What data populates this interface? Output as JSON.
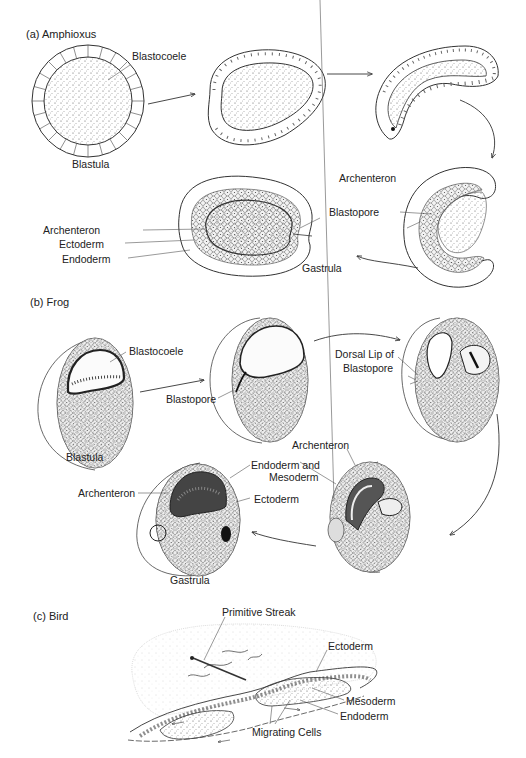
{
  "sections": [
    {
      "id": "a",
      "title": "(a)  Amphioxus",
      "labels": {
        "blastocoele": "Blastocoele",
        "blastula": "Blastula",
        "archenteron_right": "Archenteron",
        "blastopore": "Blastopore",
        "archenteron_left": "Archenteron",
        "ectoderm": "Ectoderm",
        "endoderm": "Endoderm",
        "gastrula": "Gastrula"
      }
    },
    {
      "id": "b",
      "title": "(b)  Frog",
      "labels": {
        "blastocoele": "Blastocoele",
        "blastula": "Blastula",
        "blastopore": "Blastopore",
        "dorsal_lip_line1": "Dorsal Lip of",
        "dorsal_lip_line2": "Blastopore",
        "archenteron_right": "Archenteron",
        "endoderm_mesoderm_line1": "Endoderm and",
        "endoderm_mesoderm_line2": "Mesoderm",
        "ectoderm": "Ectoderm",
        "archenteron_left": "Archenteron",
        "gastrula": "Gastrula"
      }
    },
    {
      "id": "c",
      "title": "(c)  Bird",
      "labels": {
        "primitive_streak": "Primitive Streak",
        "ectoderm": "Ectoderm",
        "mesoderm": "Mesoderm",
        "endoderm": "Endoderm",
        "migrating_cells": "Migrating Cells"
      }
    }
  ],
  "colors": {
    "ink": "#222222",
    "stipple": "#555555",
    "background": "#ffffff"
  }
}
